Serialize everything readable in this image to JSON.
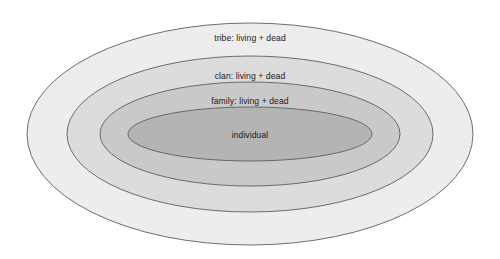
{
  "diagram": {
    "type": "concentric-ellipse-venn",
    "background_color": "#ffffff",
    "stroke_color": "#5d5d5d",
    "text_color": "#1b1b1b",
    "center": {
      "x": 250,
      "y": 134
    },
    "rings": [
      {
        "id": "tribe",
        "label": "tribe: living + dead",
        "fill": "#ededed",
        "rx": 223,
        "ry": 111,
        "label_x": 250,
        "label_y": 41
      },
      {
        "id": "clan",
        "label": "clan: living + dead",
        "fill": "#dcdcdc",
        "rx": 183,
        "ry": 78,
        "label_x": 250,
        "label_y": 79
      },
      {
        "id": "family",
        "label": "family: living + dead",
        "fill": "#c9c9c9",
        "rx": 150,
        "ry": 52,
        "label_x": 250,
        "label_y": 104
      },
      {
        "id": "individual",
        "label": "individual",
        "fill": "#b4b4b4",
        "rx": 122,
        "ry": 27,
        "label_x": 250,
        "label_y": 138
      }
    ]
  }
}
